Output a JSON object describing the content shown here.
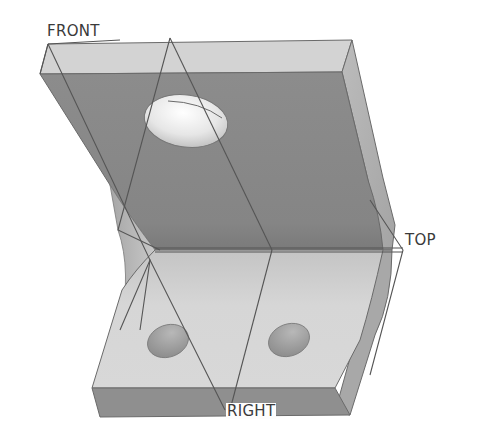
{
  "figure": {
    "datum_planes": {
      "front": "FRONT",
      "top": "TOP",
      "right": "RIGHT"
    },
    "colors": {
      "background": "#ffffff",
      "upper_face": "#8a8a8a",
      "upper_top_edge": "#d2d2d2",
      "side_face": "#b8b8b8",
      "lower_face": "#d0d0d0",
      "lower_front_edge": "#8e8e8e",
      "datum_line": "#555555",
      "label_text": "#3a3a3a"
    }
  }
}
